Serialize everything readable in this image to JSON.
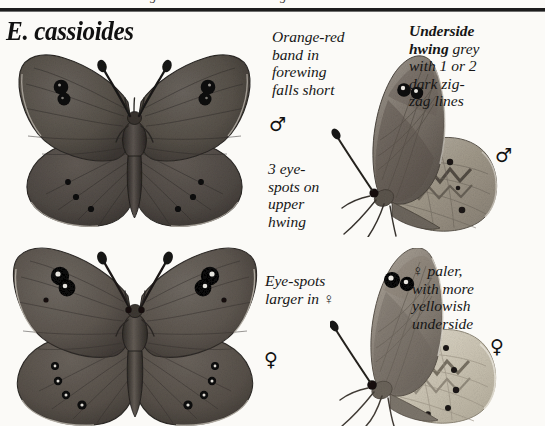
{
  "page": {
    "background_color": "#fbfaf7",
    "rule_color": "#1c1c1c",
    "clipped_header_fragment": "guide"
  },
  "title": {
    "text": "E. cassioides",
    "style": "bold italic serif"
  },
  "annotations": [
    {
      "id": "orange-red-band",
      "text": "Orange-red\nband in\nforewing\nfalls short",
      "bold_lead": "",
      "sex_symbol": "♂",
      "target": "male-upperside-forewing"
    },
    {
      "id": "three-eye-spots",
      "text": "3 eye-\nspots on\nupper\nhwing",
      "bold_lead": "",
      "sex_symbol": "",
      "target": "male-upperside-hindwing"
    },
    {
      "id": "eye-spots-larger",
      "text": "Eye-spots\nlarger in ♀",
      "bold_lead": "",
      "sex_symbol": "♀",
      "target": "female-upperside"
    },
    {
      "id": "underside-hwing-grey",
      "bold_lead": "Underside\nhwing",
      "text": " grey\nwith 1 or 2\ndark zig-\nzag lines",
      "sex_symbol": "♂",
      "target": "male-underside-hindwing"
    },
    {
      "id": "female-paler-underside",
      "text": "♀ paler,\nwith more\nyellowish\nunderside",
      "bold_lead": "",
      "sex_symbol": "♀",
      "target": "female-underside"
    }
  ],
  "symbols": {
    "male": "♂",
    "female": "♀"
  },
  "figures": [
    {
      "id": "male-upperside",
      "sex": "male",
      "view": "upperside",
      "wing_color": "#5a5551",
      "wing_dark": "#3d3935",
      "forewing_eyespots": 2,
      "hindwing_eyespots": 3,
      "eyespot_color": "#0d0d0d"
    },
    {
      "id": "female-upperside",
      "sex": "female",
      "view": "upperside",
      "wing_color": "#615c57",
      "wing_dark": "#423d39",
      "forewing_eyespots": 2,
      "hindwing_eyespots": 4,
      "eyespot_color": "#0b0b0b",
      "pupil_color": "#e9e6df"
    },
    {
      "id": "male-underside",
      "sex": "male",
      "view": "underside",
      "forewing_color": "#7c746c",
      "hindwing_color": "#9e978d",
      "zigzag_color": "#4e4841",
      "forewing_eyespots": 2,
      "hindwing_dots": 3
    },
    {
      "id": "female-underside",
      "sex": "female",
      "view": "underside",
      "forewing_color": "#8b837a",
      "hindwing_color": "#cfc9bb",
      "zigzag_color": "#5a544c",
      "forewing_eyespots": 2,
      "hindwing_dots": 5
    }
  ]
}
